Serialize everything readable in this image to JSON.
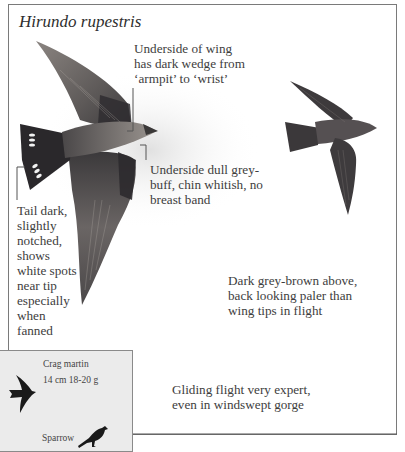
{
  "plate": {
    "species_title": "Hirundo rupestris",
    "annotations": {
      "underwing": "Underside of wing has dark wedge from ‘armpit’ to ‘wrist’",
      "underwing_lines": [
        "Underside of wing",
        "has dark wedge from",
        "‘armpit’ to ‘wrist’"
      ],
      "underside_lines": [
        "Underside dull grey-",
        "buff, chin whitish, no",
        "breast band"
      ],
      "tail_lines": [
        "Tail dark,",
        "slightly",
        "notched,",
        "shows",
        "white spots",
        "near tip",
        "especially",
        "when",
        "fanned"
      ],
      "upperparts_lines": [
        "Dark grey-brown above,",
        "back looking paler than",
        "wing tips in flight"
      ],
      "flight_lines": [
        "Gliding flight very expert,",
        "even in windswept gorge"
      ]
    },
    "size_box": {
      "species_name": "Crag martin",
      "measurements": "14 cm  18-20 g",
      "comparison_label": "Sparrow"
    },
    "colors": {
      "bird_dark": "#2f2f33",
      "bird_mid": "#5a5658",
      "bird_light": "#8f8a86",
      "inset_bg": "#ebebeb",
      "frame": "#7a7a7a"
    }
  }
}
